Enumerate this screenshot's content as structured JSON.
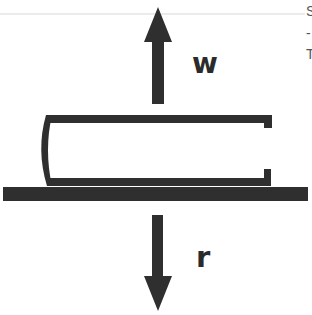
{
  "diagram": {
    "colors": {
      "ink": "#2f2f2f",
      "background": "#ffffff",
      "rule": "#e4e4e4"
    },
    "forces": [
      {
        "id": "upward-force",
        "label": "w",
        "direction": "up"
      },
      {
        "id": "downward-force",
        "label": "r",
        "direction": "down"
      }
    ],
    "objects": [
      {
        "id": "bracket-shape",
        "description": "open C-shaped bracket resting on surface"
      },
      {
        "id": "ground-surface",
        "description": "horizontal surface bar"
      }
    ]
  },
  "clipped_text": {
    "line1": "S",
    "line2": "-",
    "line3": "T"
  }
}
